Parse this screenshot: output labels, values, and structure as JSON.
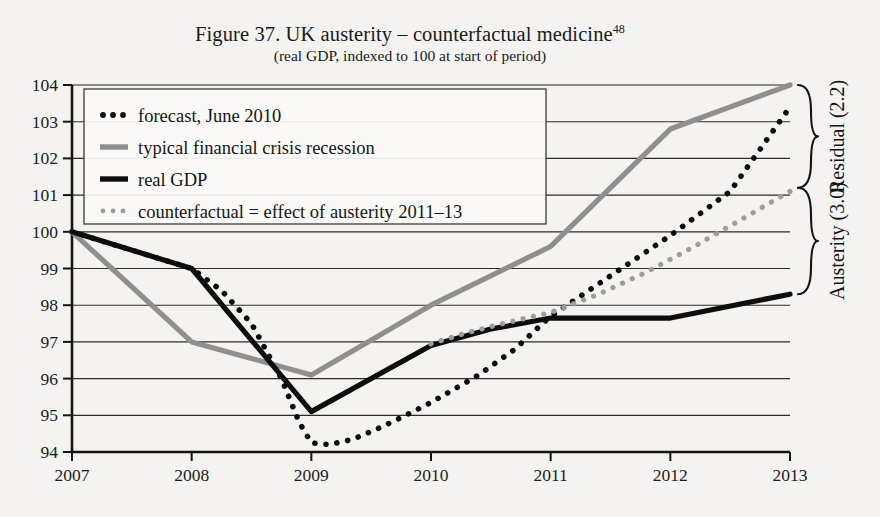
{
  "figure": {
    "title_main": "Figure 37. UK austerity – counterfactual medicine",
    "title_footnote": "48",
    "subtitle": "(real GDP, indexed to 100 at start of period)"
  },
  "annotations": {
    "residual_label": "Residual (2.2)",
    "austerity_label": "Austerity (3.0)"
  },
  "colors": {
    "background": "#f4f3f1",
    "real_gdp": "#0d0d0d",
    "forecast": "#0d0d0d",
    "typical_recession": "#8f8f8f",
    "counterfactual": "#9d9d9d",
    "gridline": "#2b2b2b",
    "axis": "#141414"
  },
  "chart_data": {
    "type": "line",
    "title": "Figure 37. UK austerity – counterfactual medicine",
    "subtitle": "(real GDP, indexed to 100 at start of period)",
    "xlabel": "",
    "ylabel": "",
    "xlim": [
      2007,
      2013
    ],
    "ylim": [
      94,
      104
    ],
    "grid": true,
    "legend_position": "top-left",
    "xticks": [
      "2007",
      "2008",
      "2009",
      "2010",
      "2011",
      "2012",
      "2013"
    ],
    "yticks": [
      "94",
      "95",
      "96",
      "97",
      "98",
      "99",
      "100",
      "101",
      "102",
      "103",
      "104"
    ],
    "series": [
      {
        "name": "forecast, June 2010",
        "style": "dotted",
        "color": "#0d0d0d",
        "points": [
          [
            2007.0,
            100.0
          ],
          [
            2007.5,
            99.5
          ],
          [
            2008.0,
            99.0
          ],
          [
            2008.25,
            98.4
          ],
          [
            2008.5,
            97.5
          ],
          [
            2008.75,
            96.0
          ],
          [
            2008.9,
            94.8
          ],
          [
            2009.0,
            94.25
          ],
          [
            2009.15,
            94.2
          ],
          [
            2009.35,
            94.35
          ],
          [
            2009.6,
            94.7
          ],
          [
            2009.85,
            95.1
          ],
          [
            2010.0,
            95.35
          ],
          [
            2010.4,
            96.1
          ],
          [
            2010.7,
            96.8
          ],
          [
            2011.0,
            97.7
          ],
          [
            2011.5,
            98.8
          ],
          [
            2012.0,
            99.9
          ],
          [
            2012.5,
            101.1
          ],
          [
            2013.0,
            103.4
          ]
        ]
      },
      {
        "name": "typical financial crisis recession",
        "style": "solid",
        "color": "#8f8f8f",
        "points": [
          [
            2007.0,
            100.0
          ],
          [
            2008.0,
            97.0
          ],
          [
            2008.5,
            96.55
          ],
          [
            2009.0,
            96.1
          ],
          [
            2010.0,
            98.0
          ],
          [
            2011.0,
            99.6
          ],
          [
            2012.0,
            102.8
          ],
          [
            2013.0,
            104.0
          ]
        ]
      },
      {
        "name": "real GDP",
        "style": "solid",
        "color": "#0d0d0d",
        "points": [
          [
            2007.0,
            100.0
          ],
          [
            2008.0,
            99.0
          ],
          [
            2009.0,
            95.1
          ],
          [
            2010.0,
            96.9
          ],
          [
            2010.5,
            97.35
          ],
          [
            2011.0,
            97.65
          ],
          [
            2012.0,
            97.65
          ],
          [
            2013.0,
            98.3
          ]
        ]
      },
      {
        "name": "counterfactual = effect of austerity 2011–13",
        "style": "dotted",
        "color": "#9d9d9d",
        "points": [
          [
            2010.0,
            96.95
          ],
          [
            2010.3,
            97.25
          ],
          [
            2010.6,
            97.5
          ],
          [
            2011.0,
            97.8
          ],
          [
            2011.4,
            98.3
          ],
          [
            2011.8,
            98.9
          ],
          [
            2012.2,
            99.6
          ],
          [
            2012.6,
            100.35
          ],
          [
            2013.0,
            101.1
          ]
        ]
      }
    ],
    "brackets": [
      {
        "label": "Residual (2.2)",
        "from": 101.2,
        "to": 104.0
      },
      {
        "label": "Austerity (3.0)",
        "from": 98.3,
        "to": 101.2
      }
    ]
  },
  "legend": {
    "items": [
      {
        "label": "forecast, June 2010",
        "marker": "dotted-black"
      },
      {
        "label": "typical financial crisis recession",
        "marker": "solid-gray"
      },
      {
        "label": "real GDP",
        "marker": "solid-black"
      },
      {
        "label": "counterfactual = effect of austerity 2011–13",
        "marker": "dotted-gray"
      }
    ]
  }
}
